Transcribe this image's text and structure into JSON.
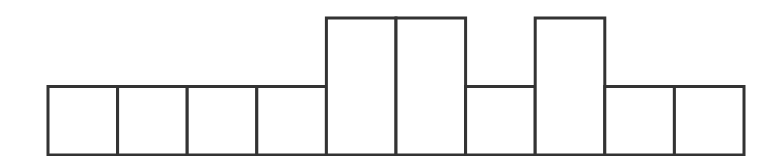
{
  "chart_data": {
    "type": "bar",
    "title": "",
    "xlabel": "",
    "ylabel": "",
    "categories": [
      "1",
      "2",
      "3",
      "4",
      "5",
      "6",
      "7",
      "8",
      "9",
      "10"
    ],
    "values": [
      1,
      1,
      1,
      1,
      2,
      2,
      1,
      2,
      1,
      1
    ],
    "ylim": [
      0,
      2
    ],
    "grid": false,
    "legend": null,
    "axes_visible": false,
    "style": {
      "fill": "#ffffff",
      "stroke": "#333333",
      "stroke_width": 3
    },
    "layout": {
      "x_start": 48,
      "x_end": 744,
      "baseline_y": 155,
      "unit_height_px": 68.5
    }
  }
}
